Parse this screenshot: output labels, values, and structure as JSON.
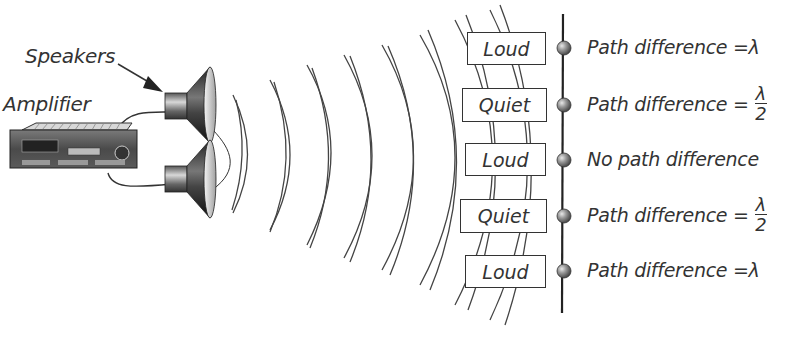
{
  "diagram": {
    "labels": {
      "speakers": "Speakers",
      "amplifier": "Amplifier"
    },
    "points": [
      {
        "state": "Loud",
        "description": "Path difference = ",
        "symbol": "λ",
        "fraction": null
      },
      {
        "state": "Quiet",
        "description": "Path difference = ",
        "symbol": null,
        "fraction": {
          "num": "λ",
          "den": "2"
        }
      },
      {
        "state": "Loud",
        "description": "No path difference",
        "symbol": null,
        "fraction": null
      },
      {
        "state": "Quiet",
        "description": "Path difference = ",
        "symbol": null,
        "fraction": {
          "num": "λ",
          "den": "2"
        }
      },
      {
        "state": "Loud",
        "description": "Path difference = ",
        "symbol": "λ",
        "fraction": null
      }
    ],
    "colors": {
      "line": "#333333",
      "ball": "#8a8a8a",
      "background": "#ffffff"
    }
  }
}
